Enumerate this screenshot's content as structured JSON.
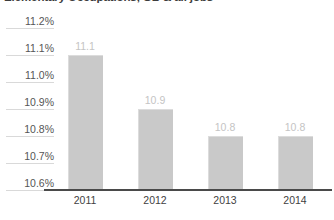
{
  "chart_data": {
    "type": "bar",
    "title": "Elementary Occupations, GB & all jobs",
    "xlabel": "",
    "ylabel": "",
    "categories": [
      "2011",
      "2012",
      "2013",
      "2014"
    ],
    "values": [
      11.1,
      10.9,
      10.8,
      10.8
    ],
    "value_labels": [
      "11.1",
      "10.9",
      "10.8",
      "10.8"
    ],
    "ylim": [
      10.6,
      11.2
    ],
    "ytick_labels": [
      "11.2%",
      "11.1%",
      "11.0%",
      "10.9%",
      "10.8%",
      "10.7%",
      "10.6%"
    ],
    "ytick_values": [
      11.2,
      11.1,
      11.0,
      10.9,
      10.8,
      10.7,
      10.6
    ],
    "grid": false,
    "legend": null,
    "series": [
      {
        "name": "Elementary Occupations",
        "values": [
          11.1,
          10.9,
          10.8,
          10.8
        ]
      }
    ],
    "colors": {
      "bar_fill": "#c9c9c9",
      "bar_edge": "#dcdcdc",
      "value_label": "#c4c4c4",
      "ytick_text": "#555555",
      "ytick_rule": "#d9d9d9",
      "xtick_text": "#3f3f3f",
      "axis_line": "#4a4a4a",
      "title_text": "#3c3c3c",
      "background": "#ffffff"
    }
  }
}
